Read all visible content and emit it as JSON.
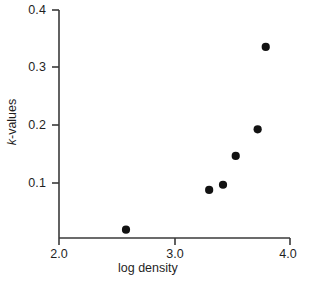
{
  "chart_data": {
    "type": "scatter",
    "title": "",
    "xlabel": "log density",
    "ylabel": "k-values",
    "ylabel_italic_prefix": "k",
    "ylabel_rest": "-values",
    "xlim": [
      2.0,
      4.0
    ],
    "ylim": [
      0.0,
      0.4
    ],
    "xticks": [
      2.0,
      3.0,
      4.0
    ],
    "xtick_labels": [
      "2.0",
      "3.0",
      "4.0"
    ],
    "yticks": [
      0.1,
      0.2,
      0.3,
      0.4
    ],
    "ytick_labels": [
      "0.1",
      "0.2",
      "0.3",
      "0.4"
    ],
    "grid": false,
    "legend": "none",
    "marker": "filled-circle",
    "marker_color": "#121212",
    "axis_color": "#3a3a3a",
    "background_color": "#ffffff",
    "points": [
      {
        "x": 2.58,
        "y": 0.019
      },
      {
        "x": 3.3,
        "y": 0.088
      },
      {
        "x": 3.42,
        "y": 0.097
      },
      {
        "x": 3.53,
        "y": 0.147
      },
      {
        "x": 3.72,
        "y": 0.193
      },
      {
        "x": 3.79,
        "y": 0.336
      }
    ],
    "series": [
      {
        "name": "k-values vs log density",
        "x": [
          2.58,
          3.3,
          3.42,
          3.53,
          3.72,
          3.79
        ],
        "values": [
          0.019,
          0.088,
          0.097,
          0.147,
          0.193,
          0.336
        ]
      }
    ]
  },
  "axis": {
    "y_tick_0": "0.4",
    "y_tick_1": "0.3",
    "y_tick_2": "0.2",
    "y_tick_3": "0.1",
    "x_tick_0": "2.0",
    "x_tick_1": "3.0",
    "x_tick_2": "4.0"
  },
  "labels": {
    "y_axis_italic": "k",
    "y_axis_rest": "-values",
    "x_axis": "log density"
  }
}
